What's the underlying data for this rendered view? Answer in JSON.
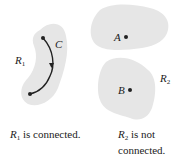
{
  "colors": {
    "region_fill": "#e6e6e6",
    "ink": "#222222",
    "background": "#ffffff"
  },
  "left_panel": {
    "region_label": "R",
    "region_subscript": "1",
    "curve_label": "C",
    "caption_var": "R",
    "caption_sub": "1",
    "caption_text": " is connected."
  },
  "right_panel": {
    "region_label": "R",
    "region_subscript": "2",
    "point_a_label": "A",
    "point_b_label": "B",
    "caption_var": "R",
    "caption_sub": "2",
    "caption_text_line1": " is not",
    "caption_text_line2": "connected."
  }
}
